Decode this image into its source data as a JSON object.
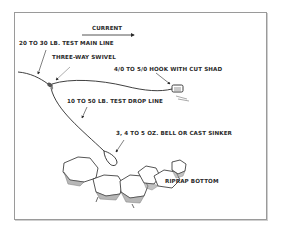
{
  "diagram": {
    "labels": {
      "current": "CURRENT",
      "main_line": "20 TO 30 LB. TEST MAIN LINE",
      "swivel": "THREE-WAY SWIVEL",
      "hook": "4/0 TO 5/0 HOOK WITH CUT SHAD",
      "drop_line": "10 TO 50 LB. TEST DROP LINE",
      "sinker": "3, 4 TO 5 OZ. BELL OR CAST SINKER",
      "bottom": "RIPRAP BOTTOM"
    },
    "colors": {
      "ink": "#2a2a2a",
      "frame": "#9a9a9a",
      "background": "#ffffff"
    }
  }
}
